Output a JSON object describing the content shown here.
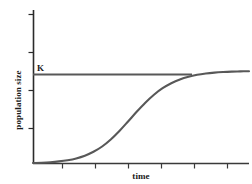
{
  "chart_data": {
    "type": "line",
    "title": "",
    "xlabel": "time",
    "ylabel": "population size",
    "grid": false,
    "legend_position": "none",
    "xlim": [
      0,
      1
    ],
    "ylim": [
      0,
      1
    ],
    "xticks_labels": [
      "",
      "",
      "",
      "",
      "",
      ""
    ],
    "yticks_labels": [
      "",
      "",
      "",
      ""
    ],
    "annotations": [
      {
        "text": "K",
        "meaning": "carrying-capacity",
        "x": 0.03,
        "y": 0.9
      }
    ],
    "series": [
      {
        "name": "logistic-growth-curve",
        "type": "line",
        "color": "#585858",
        "x": [
          0.0,
          0.04,
          0.08,
          0.12,
          0.16,
          0.2,
          0.24,
          0.28,
          0.32,
          0.36,
          0.4,
          0.44,
          0.48,
          0.52,
          0.56,
          0.6,
          0.64,
          0.68,
          0.72,
          0.76,
          0.8,
          0.84,
          0.88,
          0.92,
          0.96,
          1.0
        ],
        "y": [
          0.005,
          0.008,
          0.013,
          0.021,
          0.033,
          0.051,
          0.078,
          0.117,
          0.17,
          0.24,
          0.325,
          0.42,
          0.517,
          0.608,
          0.688,
          0.753,
          0.803,
          0.841,
          0.868,
          0.887,
          0.9,
          0.909,
          0.915,
          0.919,
          0.921,
          0.923
        ]
      },
      {
        "name": "carrying-capacity-line",
        "type": "hline",
        "color": "#585858",
        "y": 0.875,
        "x_start": 0.0,
        "x_end": 0.735
      }
    ],
    "axis_color": "#2b2b2b",
    "curve_color": "#585858",
    "background": "#ffffff"
  }
}
